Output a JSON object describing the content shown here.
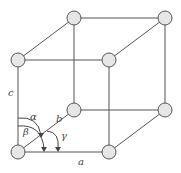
{
  "diagram": {
    "colors": {
      "edge": "#555555",
      "atom_fill": "#e6e6e6",
      "atom_stroke": "#555555",
      "label": "#444444"
    },
    "atoms": [
      {
        "id": "front-bottom-left",
        "x": 18,
        "y": 152
      },
      {
        "id": "front-bottom-right",
        "x": 109,
        "y": 152
      },
      {
        "id": "front-top-left",
        "x": 18,
        "y": 60
      },
      {
        "id": "front-top-right",
        "x": 109,
        "y": 60
      },
      {
        "id": "back-bottom-left",
        "x": 74,
        "y": 110
      },
      {
        "id": "back-bottom-right",
        "x": 165,
        "y": 110
      },
      {
        "id": "back-top-left",
        "x": 74,
        "y": 18
      },
      {
        "id": "back-top-right",
        "x": 165,
        "y": 18
      }
    ],
    "labels": {
      "a": "a",
      "b": "b",
      "c": "c",
      "alpha": "α",
      "beta": "β",
      "gamma": "γ"
    }
  }
}
